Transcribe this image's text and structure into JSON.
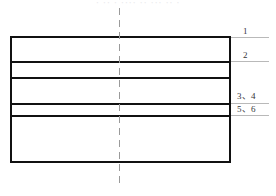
{
  "figure": {
    "top_cut_text": "· ·· · ···· ·· ··· ·· ·",
    "colors": {
      "line": "#111111",
      "centerline": "#9a9a9a",
      "leader": "#b9b9b9",
      "label_text": "#35353a",
      "background": "#ffffff"
    },
    "rect": {
      "left": 10,
      "top": 36,
      "width": 221,
      "height": 127
    },
    "dividers": [
      {
        "id": "divider-1",
        "y": 61
      },
      {
        "id": "divider-2",
        "y": 77
      },
      {
        "id": "divider-3",
        "y": 103
      },
      {
        "id": "divider-4",
        "y": 115
      }
    ],
    "centerline": {
      "x": 119,
      "top": 8,
      "height": 180,
      "style": "dash-dot"
    },
    "callouts": [
      {
        "id": "callout-1",
        "label": "1",
        "leader_y": 37
      },
      {
        "id": "callout-2",
        "label": "2",
        "leader_y": 61
      },
      {
        "id": "callout-3",
        "label": "3、4",
        "leader_y": 103
      },
      {
        "id": "callout-4",
        "label": "5、6",
        "leader_y": 115
      }
    ]
  }
}
